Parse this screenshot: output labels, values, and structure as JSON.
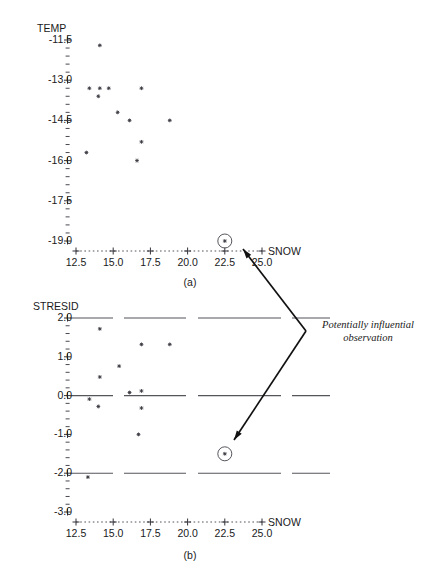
{
  "figure": {
    "annotation": {
      "line1": "Potentially influential",
      "line2": "observation"
    },
    "panel_a_label": "(a)",
    "panel_b_label": "(b)"
  },
  "chart_data": [
    {
      "type": "scatter",
      "panel": "(a)",
      "title": "",
      "xlabel": "SNOW",
      "ylabel": "TEMP",
      "xlim": [
        11.8,
        25.9
      ],
      "ylim": [
        -19.6,
        -11.2
      ],
      "xticks": [
        12.5,
        15.0,
        17.5,
        20.0,
        22.5,
        25.0
      ],
      "xtick_labels": [
        "12.5",
        "15.0",
        "17.5",
        "20.0",
        "22.5",
        "25.0"
      ],
      "yticks": [
        -11.5,
        -13.0,
        -14.5,
        -16.0,
        -17.5,
        -19.0
      ],
      "ytick_labels": [
        "-11.5",
        "-13.0",
        "-14.5",
        "-16.0",
        "-17.5",
        "-19.0"
      ],
      "grid": false,
      "legend": "none",
      "marker": "asterisk",
      "points": [
        {
          "x": 14.1,
          "y": -11.7
        },
        {
          "x": 13.4,
          "y": -13.3
        },
        {
          "x": 14.1,
          "y": -13.3
        },
        {
          "x": 14.7,
          "y": -13.3
        },
        {
          "x": 16.9,
          "y": -13.3
        },
        {
          "x": 14.0,
          "y": -13.6
        },
        {
          "x": 15.3,
          "y": -14.2
        },
        {
          "x": 16.1,
          "y": -14.5
        },
        {
          "x": 18.8,
          "y": -14.5
        },
        {
          "x": 16.9,
          "y": -15.3
        },
        {
          "x": 13.2,
          "y": -15.7
        },
        {
          "x": 16.6,
          "y": -16.0
        }
      ],
      "highlighted_points": [
        {
          "x": 22.5,
          "y": -19.0,
          "marker": "circled-asterisk"
        }
      ]
    },
    {
      "type": "scatter",
      "panel": "(b)",
      "title": "",
      "xlabel": "SNOW",
      "ylabel": "STRESID",
      "xlim": [
        11.8,
        25.9
      ],
      "ylim": [
        -3.35,
        2.3
      ],
      "xticks": [
        12.5,
        15.0,
        17.5,
        20.0,
        22.5,
        25.0
      ],
      "xtick_labels": [
        "12.5",
        "15.0",
        "17.5",
        "20.0",
        "22.5",
        "25.0"
      ],
      "yticks": [
        2.0,
        1.0,
        0.0,
        -1.0,
        -2.0,
        -3.0
      ],
      "ytick_labels": [
        "2.0",
        "1.0",
        "0.0",
        "-1.0",
        "-2.0",
        "-3.0"
      ],
      "grid": false,
      "legend": "none",
      "marker": "asterisk",
      "reference_lines": [
        2.0,
        0.0,
        -2.0
      ],
      "points": [
        {
          "x": 14.1,
          "y": 1.72
        },
        {
          "x": 16.9,
          "y": 1.32
        },
        {
          "x": 18.8,
          "y": 1.32
        },
        {
          "x": 15.4,
          "y": 0.76
        },
        {
          "x": 14.1,
          "y": 0.48
        },
        {
          "x": 13.4,
          "y": -0.09
        },
        {
          "x": 16.1,
          "y": 0.08
        },
        {
          "x": 16.9,
          "y": 0.12
        },
        {
          "x": 14.0,
          "y": -0.28
        },
        {
          "x": 16.9,
          "y": -0.32
        },
        {
          "x": 16.7,
          "y": -1.0
        },
        {
          "x": 13.3,
          "y": -2.1
        }
      ],
      "highlighted_points": [
        {
          "x": 22.5,
          "y": -1.5,
          "marker": "circled-asterisk"
        }
      ]
    }
  ]
}
